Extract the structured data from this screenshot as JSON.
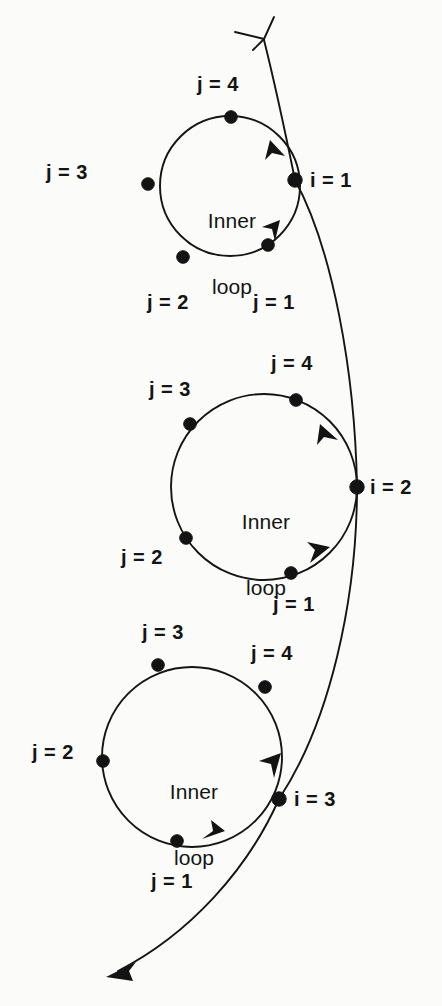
{
  "figure": {
    "kind": "nested-loop-flow-diagram",
    "background_color": "#fbfbf9",
    "ink_color": "#131313",
    "inner_loop_text_line1": "Inner",
    "inner_loop_text_line2": "loop"
  },
  "outer_loop": {
    "nodes": [
      {
        "id": "i1",
        "label": "i = 1",
        "x": 295,
        "y": 180
      },
      {
        "id": "i2",
        "label": "i = 2",
        "x": 357,
        "y": 487
      },
      {
        "id": "i3",
        "label": "i = 3",
        "x": 279,
        "y": 799
      }
    ],
    "entry_arrow": {
      "direction": "up-left",
      "style": "open-v",
      "x": 262,
      "y": 36
    },
    "exit_arrow": {
      "direction": "down-left",
      "style": "filled",
      "x": 108,
      "y": 975
    }
  },
  "inner_loops": [
    {
      "id": "loop-1",
      "center_x": 230,
      "center_y": 186,
      "radius": 70,
      "title_line1": "Inner",
      "title_line2": "loop",
      "anchor_label": "i = 1",
      "steps": [
        {
          "label": "j = 1",
          "x": 268,
          "y": 245
        },
        {
          "label": "j = 2",
          "x": 183,
          "y": 257
        },
        {
          "label": "j = 3",
          "x": 148,
          "y": 184
        },
        {
          "label": "j = 4",
          "x": 231,
          "y": 117
        }
      ],
      "step_label_positions": [
        {
          "label": "j = 1",
          "x": 274,
          "y": 302,
          "align": "center"
        },
        {
          "label": "j = 2",
          "x": 168,
          "y": 302,
          "align": "center"
        },
        {
          "label": "j = 3",
          "x": 67,
          "y": 172,
          "align": "center"
        },
        {
          "label": "j = 4",
          "x": 218,
          "y": 84,
          "align": "center"
        }
      ]
    },
    {
      "id": "loop-2",
      "center_x": 264,
      "center_y": 487,
      "radius": 93,
      "title_line1": "Inner",
      "title_line2": "loop",
      "anchor_label": "i = 2",
      "steps": [
        {
          "label": "j = 1",
          "x": 291,
          "y": 573
        },
        {
          "label": "j = 2",
          "x": 186,
          "y": 538
        },
        {
          "label": "j = 3",
          "x": 190,
          "y": 424
        },
        {
          "label": "j = 4",
          "x": 296,
          "y": 400
        }
      ],
      "step_label_positions": [
        {
          "label": "j = 1",
          "x": 294,
          "y": 604,
          "align": "center"
        },
        {
          "label": "j = 2",
          "x": 142,
          "y": 557,
          "align": "center"
        },
        {
          "label": "j = 3",
          "x": 170,
          "y": 389,
          "align": "center"
        },
        {
          "label": "j = 4",
          "x": 292,
          "y": 363,
          "align": "center"
        }
      ]
    },
    {
      "id": "loop-3",
      "center_x": 192,
      "center_y": 757,
      "radius": 90,
      "title_line1": "Inner",
      "title_line2": "loop",
      "anchor_label": "i = 3",
      "steps": [
        {
          "label": "j = 1",
          "x": 177,
          "y": 841
        },
        {
          "label": "j = 2",
          "x": 103,
          "y": 761
        },
        {
          "label": "j = 3",
          "x": 158,
          "y": 665
        },
        {
          "label": "j = 4",
          "x": 265,
          "y": 687
        }
      ],
      "step_label_positions": [
        {
          "label": "j = 1",
          "x": 172,
          "y": 881,
          "align": "center"
        },
        {
          "label": "j = 2",
          "x": 53,
          "y": 752,
          "align": "center"
        },
        {
          "label": "j = 3",
          "x": 163,
          "y": 632,
          "align": "center"
        },
        {
          "label": "j = 4",
          "x": 272,
          "y": 653,
          "align": "center"
        }
      ]
    }
  ],
  "index_labels": [
    {
      "text": "i = 1",
      "x": 310,
      "y": 170
    },
    {
      "text": "i = 2",
      "x": 370,
      "y": 477
    },
    {
      "text": "i = 3",
      "x": 294,
      "y": 789
    }
  ]
}
